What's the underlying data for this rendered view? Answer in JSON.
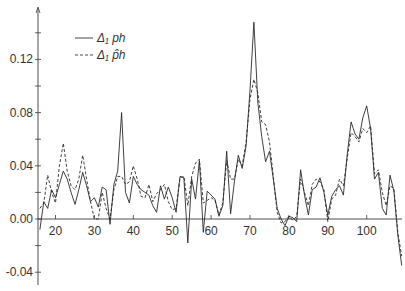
{
  "chart_data": {
    "type": "line",
    "title": "",
    "xlabel": "",
    "ylabel": "",
    "xlim": [
      15.5,
      110
    ],
    "ylim": [
      -0.05,
      0.16
    ],
    "grid": false,
    "legend_position": "upper-left",
    "x_ticks": [
      20,
      30,
      40,
      50,
      60,
      70,
      80,
      90,
      100
    ],
    "x_tick_labels": [
      "20",
      "30",
      "40",
      "50",
      "60",
      "70",
      "80",
      "90",
      "100"
    ],
    "y_ticks": [
      -0.04,
      0.0,
      0.04,
      0.08,
      0.12
    ],
    "y_tick_labels": [
      "-0.04",
      "0.00",
      "0.04",
      "0.08",
      "0.12"
    ],
    "y_minor_ticks": [
      -0.02,
      0.02,
      0.06,
      0.1,
      0.14
    ],
    "legend": [
      {
        "label": "Δ₁ ph",
        "style": "solid"
      },
      {
        "label": "Δ₁ p̂h",
        "style": "dashed"
      }
    ],
    "x": [
      16,
      17,
      18,
      19,
      20,
      21,
      22,
      23,
      24,
      25,
      26,
      27,
      28,
      29,
      30,
      31,
      32,
      33,
      34,
      35,
      36,
      37,
      38,
      39,
      40,
      41,
      42,
      43,
      44,
      45,
      46,
      47,
      48,
      49,
      50,
      51,
      52,
      53,
      54,
      55,
      56,
      57,
      58,
      59,
      60,
      61,
      62,
      63,
      64,
      65,
      66,
      67,
      68,
      69,
      70,
      71,
      72,
      73,
      74,
      75,
      76,
      77,
      78,
      79,
      80,
      81,
      82,
      83,
      84,
      85,
      86,
      87,
      88,
      89,
      90,
      91,
      92,
      93,
      94,
      95,
      96,
      97,
      98,
      99,
      100,
      101,
      102,
      103,
      104,
      105,
      106,
      107,
      108,
      109
    ],
    "series": [
      {
        "name": "Δ1 ph",
        "style": "solid",
        "values": [
          -0.008,
          0.013,
          0.008,
          0.022,
          0.016,
          0.026,
          0.036,
          0.03,
          0.02,
          0.011,
          0.022,
          0.035,
          0.025,
          0.013,
          0.016,
          0.009,
          0.024,
          0.022,
          -0.004,
          0.026,
          0.036,
          0.08,
          0.02,
          0.012,
          0.032,
          0.026,
          0.022,
          0.02,
          0.018,
          0.01,
          0.005,
          0.025,
          0.015,
          0.024,
          0.016,
          0.005,
          0.032,
          0.031,
          -0.018,
          0.03,
          0.015,
          0.044,
          -0.01,
          0.021,
          0.018,
          0.015,
          0.002,
          0.01,
          0.051,
          0.004,
          0.028,
          0.048,
          0.038,
          0.055,
          0.097,
          0.148,
          0.088,
          0.062,
          0.043,
          0.051,
          0.03,
          0.008,
          0.0,
          -0.005,
          0.002,
          0.001,
          -0.002,
          0.037,
          0.018,
          0.003,
          0.022,
          0.024,
          0.031,
          0.02,
          0.003,
          0.017,
          0.022,
          0.025,
          0.018,
          0.049,
          0.073,
          0.064,
          0.06,
          0.076,
          0.085,
          0.068,
          0.03,
          0.035,
          0.008,
          0.003,
          0.033,
          0.021,
          -0.012,
          -0.035
        ]
      },
      {
        "name": "Δ1 p̂h",
        "style": "dashed",
        "values": [
          0.008,
          0.012,
          0.033,
          0.02,
          0.012,
          0.04,
          0.057,
          0.036,
          0.025,
          0.022,
          0.03,
          0.048,
          0.03,
          0.013,
          0.0,
          0.0,
          0.02,
          0.008,
          0.0,
          0.022,
          0.032,
          0.032,
          0.026,
          0.028,
          0.04,
          0.03,
          0.017,
          0.016,
          0.026,
          0.013,
          0.019,
          0.022,
          0.026,
          0.013,
          0.007,
          0.008,
          0.031,
          0.032,
          0.01,
          0.032,
          0.042,
          0.045,
          0.012,
          0.014,
          0.016,
          0.014,
          0.003,
          0.012,
          0.044,
          0.03,
          0.03,
          0.045,
          0.04,
          0.058,
          0.09,
          0.105,
          0.095,
          0.073,
          0.071,
          0.058,
          0.032,
          0.005,
          -0.003,
          -0.002,
          0.002,
          -0.001,
          0.002,
          0.03,
          0.02,
          0.01,
          0.026,
          0.03,
          0.028,
          0.022,
          -0.002,
          0.015,
          0.018,
          0.03,
          0.025,
          0.046,
          0.065,
          0.062,
          0.058,
          0.068,
          0.065,
          0.07,
          0.034,
          0.037,
          0.02,
          0.01,
          0.025,
          0.023,
          -0.01,
          -0.028
        ]
      }
    ],
    "annotations": [],
    "end_marker": {
      "x": 110,
      "y_top": 0.055,
      "y_bottom": -0.033
    }
  }
}
